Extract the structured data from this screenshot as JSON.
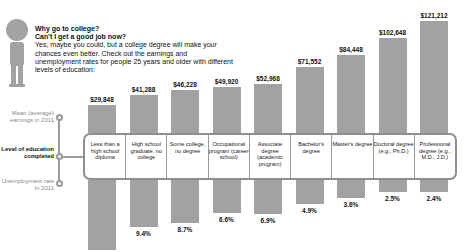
{
  "intro": {
    "heading1": "Why go to college?",
    "heading2": "Can't I get a good job now?",
    "body": "Yes, maybe you could, but a college degree will make your chances even better. Check out the earnings and unemployment rates for people 25 years and older with different levels of education:"
  },
  "axis_labels": {
    "earnings": "Mean (average) earnings in 2011",
    "level": "Level of education completed",
    "unemployment": "Unemployment rate in 2011"
  },
  "chart_data": {
    "type": "bar",
    "title": "Why go to college?",
    "categories": [
      "Less than a high school diploma",
      "High school graduate, no college",
      "Some college, no degree",
      "Occupational program (career school)",
      "Associate degree (academic program)",
      "Bachelor's degree",
      "Master's degree",
      "Doctoral degree (e.g., Ph.D.)",
      "Professional degree (e.g., M.D., J.D.)"
    ],
    "series": [
      {
        "name": "Mean (average) earnings in 2011",
        "values": [
          29848,
          41288,
          46228,
          49920,
          52968,
          71552,
          84448,
          102648,
          121212
        ],
        "labels": [
          "$29,848",
          "$41,288",
          "$46,228",
          "$49,920",
          "$52,968",
          "$71,552",
          "$84,448",
          "$102,648",
          "$121,212"
        ],
        "direction": "up"
      },
      {
        "name": "Unemployment rate in 2011",
        "values": [
          14.1,
          9.4,
          8.7,
          6.6,
          6.9,
          4.9,
          3.6,
          2.5,
          2.4
        ],
        "labels": [
          "14.1%",
          "9.4%",
          "8.7%",
          "6.6%",
          "6.9%",
          "4.9%",
          "3.6%",
          "2.5%",
          "2.4%"
        ],
        "direction": "down"
      }
    ],
    "xlabel": "Level of education completed",
    "ylabel": "",
    "grid": false,
    "legend": "left side labels"
  },
  "colors": {
    "bar": "#a2a2a2",
    "border": "#8f8f8f"
  }
}
